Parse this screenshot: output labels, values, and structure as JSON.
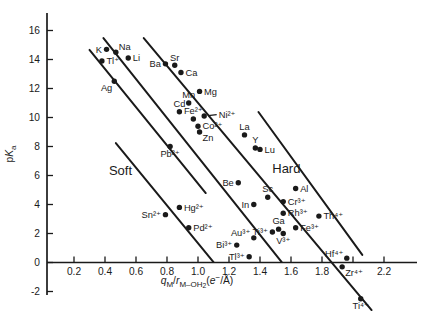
{
  "figure": {
    "width": 430,
    "height": 325,
    "background": "#ffffff",
    "ink": "#1a1a1a"
  },
  "chart_data": {
    "type": "scatter",
    "title": "",
    "xlabel": "qM/rM-OH2 (e-/Å)",
    "ylabel": "pKa",
    "xlim": [
      0,
      2.42
    ],
    "ylim": [
      -3.3,
      16.5
    ],
    "grid": false,
    "x_ticks": [
      {
        "v": 0.2,
        "label": "0.2"
      },
      {
        "v": 0.4,
        "label": "0.4"
      },
      {
        "v": 0.6,
        "label": "0.6"
      },
      {
        "v": 0.8,
        "label": "0.8"
      },
      {
        "v": 1.0,
        "label": "1.0"
      },
      {
        "v": 1.2,
        "label": "1.2"
      },
      {
        "v": 1.4,
        "label": "1.4"
      },
      {
        "v": 1.6,
        "label": "1.6"
      },
      {
        "v": 1.8,
        "label": "1.8"
      },
      {
        "v": 2.0,
        "label": ""
      },
      {
        "v": 2.2,
        "label": "2.2"
      }
    ],
    "y_ticks": [
      {
        "v": -2,
        "label": "-2"
      },
      {
        "v": 0,
        "label": "0"
      },
      {
        "v": 2,
        "label": "2"
      },
      {
        "v": 4,
        "label": "4"
      },
      {
        "v": 6,
        "label": "6"
      },
      {
        "v": 8,
        "label": "8"
      },
      {
        "v": 10,
        "label": "10"
      },
      {
        "v": 12,
        "label": "12"
      },
      {
        "v": 14,
        "label": "14"
      },
      {
        "v": 16,
        "label": "16"
      }
    ],
    "regions": [
      {
        "label": "Soft",
        "x": 0.5,
        "pka": 6.3
      },
      {
        "label": "Hard",
        "x": 1.57,
        "pka": 6.45
      }
    ],
    "lines": [
      {
        "name": "soft-plus1",
        "x1": 0.3,
        "pka1": 14.66,
        "x2": 1.05,
        "pka2": 4.79
      },
      {
        "name": "plus1",
        "x1": 0.39,
        "pka1": 15.48,
        "x2": 1.54,
        "pka2": 0.03
      },
      {
        "name": "plus2",
        "x1": 0.65,
        "pka1": 15.48,
        "x2": 2.12,
        "pka2": -3.28
      },
      {
        "name": "plus3",
        "x1": 1.39,
        "pka1": 10.38,
        "x2": 2.06,
        "pka2": 0.52
      },
      {
        "name": "soft-divider",
        "x1": 0.47,
        "pka1": 8.24,
        "x2": 1.1,
        "pka2": 0.03
      }
    ],
    "points": [
      {
        "label": "K",
        "x": 0.41,
        "pka": 14.7,
        "pos": "left"
      },
      {
        "label": "Na",
        "x": 0.47,
        "pka": 14.5,
        "pos": "above-right"
      },
      {
        "label": "Tl⁺",
        "x": 0.38,
        "pka": 13.9,
        "pos": "right"
      },
      {
        "label": "Li",
        "x": 0.55,
        "pka": 14.1,
        "pos": "right"
      },
      {
        "label": "Ag",
        "x": 0.46,
        "pka": 12.5,
        "pos": "below-left"
      },
      {
        "label": "Ba",
        "x": 0.79,
        "pka": 13.7,
        "pos": "left"
      },
      {
        "label": "Sr",
        "x": 0.85,
        "pka": 13.6,
        "pos": "above"
      },
      {
        "label": "Ca",
        "x": 0.89,
        "pka": 13.1,
        "pos": "right"
      },
      {
        "label": "Mg",
        "x": 1.01,
        "pka": 11.8,
        "pos": "right"
      },
      {
        "label": "Mn",
        "x": 0.94,
        "pka": 11.0,
        "pos": "above"
      },
      {
        "label": "Cd",
        "x": 0.88,
        "pka": 10.4,
        "pos": "above"
      },
      {
        "label": "Fe²⁺",
        "x": 0.97,
        "pka": 9.9,
        "pos": "above"
      },
      {
        "label": "Ni²⁺",
        "x": 1.04,
        "pka": 10.1,
        "pos": "right-leader"
      },
      {
        "label": "Co²⁺",
        "x": 1.0,
        "pka": 9.4,
        "pos": "right"
      },
      {
        "label": "Zn",
        "x": 1.01,
        "pka": 9.0,
        "pos": "below-right"
      },
      {
        "label": "La",
        "x": 1.3,
        "pka": 8.8,
        "pos": "above"
      },
      {
        "label": "Y",
        "x": 1.37,
        "pka": 7.9,
        "pos": "above"
      },
      {
        "label": "Lu",
        "x": 1.4,
        "pka": 7.8,
        "pos": "right"
      },
      {
        "label": "Pb²⁺",
        "x": 0.82,
        "pka": 8.0,
        "pos": "below"
      },
      {
        "label": "Be",
        "x": 1.26,
        "pka": 5.5,
        "pos": "left"
      },
      {
        "label": "Al",
        "x": 1.63,
        "pka": 5.1,
        "pos": "right"
      },
      {
        "label": "Sc",
        "x": 1.45,
        "pka": 4.5,
        "pos": "above"
      },
      {
        "label": "In",
        "x": 1.36,
        "pka": 4.0,
        "pos": "left"
      },
      {
        "label": "Cr³⁺",
        "x": 1.55,
        "pka": 4.2,
        "pos": "right"
      },
      {
        "label": "Rh³⁺",
        "x": 1.55,
        "pka": 3.4,
        "pos": "right"
      },
      {
        "label": "Th⁴⁺",
        "x": 1.78,
        "pka": 3.2,
        "pos": "right"
      },
      {
        "label": "Ga",
        "x": 1.52,
        "pka": 2.3,
        "pos": "above"
      },
      {
        "label": "Fe³⁺",
        "x": 1.63,
        "pka": 2.4,
        "pos": "right"
      },
      {
        "label": "Ti³⁺",
        "x": 1.48,
        "pka": 2.1,
        "pos": "left"
      },
      {
        "label": "V³⁺",
        "x": 1.55,
        "pka": 2.0,
        "pos": "below"
      },
      {
        "label": "Sn²⁺",
        "x": 0.79,
        "pka": 3.3,
        "pos": "left"
      },
      {
        "label": "Hg²⁺",
        "x": 0.88,
        "pka": 3.8,
        "pos": "right"
      },
      {
        "label": "Pd²⁺",
        "x": 0.94,
        "pka": 2.4,
        "pos": "right"
      },
      {
        "label": "Au³⁺",
        "x": 1.36,
        "pka": 1.7,
        "pos": "upper-left"
      },
      {
        "label": "Bi³⁺",
        "x": 1.25,
        "pka": 1.2,
        "pos": "left"
      },
      {
        "label": "Tl³⁺",
        "x": 1.33,
        "pka": 0.4,
        "pos": "left"
      },
      {
        "label": "Hf⁴⁺",
        "x": 1.96,
        "pka": 0.3,
        "pos": "upper-left"
      },
      {
        "label": "Zr⁴⁺",
        "x": 1.93,
        "pka": -0.3,
        "pos": "below-right"
      },
      {
        "label": "Ti⁴⁺",
        "x": 2.05,
        "pka": -2.5,
        "pos": "below"
      }
    ],
    "xlabel_parts": [
      {
        "t": "q",
        "i": true,
        "lvl": "base"
      },
      {
        "t": "M",
        "lvl": "sub"
      },
      {
        "t": "/",
        "lvl": "base"
      },
      {
        "t": "r",
        "i": true,
        "lvl": "base"
      },
      {
        "t": "M–OH",
        "lvl": "sub"
      },
      {
        "t": "2",
        "lvl": "subsub"
      },
      {
        "t": "(",
        "lvl": "base"
      },
      {
        "t": "e",
        "i": true,
        "lvl": "base"
      },
      {
        "t": "−",
        "lvl": "sup"
      },
      {
        "t": "/Å)",
        "lvl": "base"
      }
    ],
    "ylabel_parts": [
      {
        "t": "p",
        "lvl": "base"
      },
      {
        "t": "K",
        "i": true,
        "lvl": "base"
      },
      {
        "t": "a",
        "lvl": "sub"
      }
    ]
  }
}
